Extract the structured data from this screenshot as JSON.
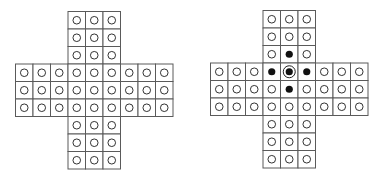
{
  "diagram": {
    "grid_size": 9,
    "arm_width": 3,
    "cell_size": 17.5,
    "colors": {
      "grid_line": "#5a5a5a",
      "hole_stroke": "#333333",
      "peg_fill": "#111111",
      "background": "#ffffff"
    },
    "boards": [
      {
        "id": "left",
        "label": "empty-board",
        "filled": [],
        "ringed": []
      },
      {
        "id": "right",
        "label": "board-with-pegs",
        "filled": [
          [
            2,
            4
          ],
          [
            3,
            3
          ],
          [
            3,
            4
          ],
          [
            3,
            5
          ],
          [
            4,
            4
          ]
        ],
        "ringed": [
          [
            3,
            4
          ]
        ]
      }
    ]
  }
}
